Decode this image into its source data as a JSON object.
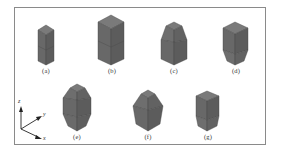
{
  "figure": {
    "colors": {
      "frame": "#8a8a8a",
      "face_front": "#6b6b6b",
      "face_side": "#5a5a5a",
      "face_top": "#7a7a7a",
      "edge": "#3a3a3a",
      "axis": "#222222"
    },
    "panels": [
      {
        "id": "a",
        "label": "(a)",
        "label_x": 46,
        "label_y": 69
      },
      {
        "id": "b",
        "label": "(b)",
        "label_x": 112,
        "label_y": 69
      },
      {
        "id": "c",
        "label": "(c)",
        "label_x": 174,
        "label_y": 69
      },
      {
        "id": "d",
        "label": "(d)",
        "label_x": 236,
        "label_y": 69
      },
      {
        "id": "e",
        "label": "(e)",
        "label_x": 77,
        "label_y": 134
      },
      {
        "id": "f",
        "label": "(f)",
        "label_x": 148,
        "label_y": 134
      },
      {
        "id": "g",
        "label": "(g)",
        "label_x": 208,
        "label_y": 134
      }
    ],
    "axes": {
      "z": "z",
      "y": "y",
      "x": "x"
    }
  }
}
